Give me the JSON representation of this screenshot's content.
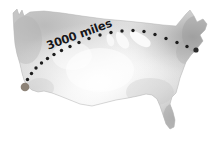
{
  "figure": {
    "background_color": "#ffffff"
  },
  "map": {
    "name": "contiguous-united-states",
    "style": "watercolor-grayscale",
    "fill_light": "#f3f3f3",
    "fill_mid": "#d8d8d8",
    "fill_dark": "#a9a9a9",
    "edge_color": "#9a9a9a"
  },
  "route": {
    "label": "3000 miles",
    "label_rotation_deg": -20,
    "dot_color": "#1d1d1d",
    "dot_count": 18,
    "dot_radius": 1.7,
    "origin_marker": {
      "name": "west-coast-origin",
      "color": "#8d8378",
      "radius": 3.1,
      "x": 25,
      "y": 87
    },
    "destination_marker": {
      "name": "east-coast-destination",
      "color": "#2b2b2b",
      "radius": 2.6,
      "x": 196,
      "y": 50
    },
    "dots": [
      {
        "x": 27.5,
        "y": 79.5
      },
      {
        "x": 31.5,
        "y": 73.5
      },
      {
        "x": 36.0,
        "y": 68.0
      },
      {
        "x": 41.5,
        "y": 63.0
      },
      {
        "x": 47.5,
        "y": 58.5
      },
      {
        "x": 54.0,
        "y": 54.5
      },
      {
        "x": 61.5,
        "y": 50.5
      },
      {
        "x": 70.0,
        "y": 46.5
      },
      {
        "x": 79.0,
        "y": 42.5
      },
      {
        "x": 89.0,
        "y": 38.5
      },
      {
        "x": 100.0,
        "y": 35.0
      },
      {
        "x": 111.0,
        "y": 32.5
      },
      {
        "x": 122.0,
        "y": 31.0
      },
      {
        "x": 133.0,
        "y": 30.5
      },
      {
        "x": 144.0,
        "y": 31.5
      },
      {
        "x": 155.0,
        "y": 34.5
      },
      {
        "x": 166.0,
        "y": 38.5
      },
      {
        "x": 177.0,
        "y": 42.5
      },
      {
        "x": 187.0,
        "y": 46.5
      }
    ]
  }
}
